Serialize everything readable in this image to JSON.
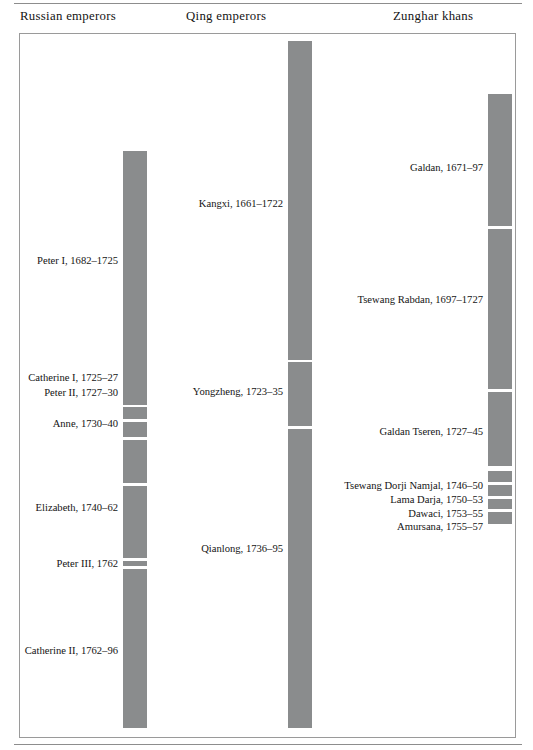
{
  "chart_data": {
    "type": "timeline",
    "title": "",
    "subtitle": "",
    "xlabel": "",
    "ylabel": "",
    "orientation": "vertical",
    "time_range": [
      1655,
      1800
    ],
    "grid": false,
    "legend": "none",
    "bar_color": "#8a8c8d",
    "frame": true,
    "columns": [
      {
        "id": "russian",
        "header": "Russian emperors",
        "bar_left_px": 103,
        "bar_width_px": 24,
        "label_align": "right",
        "label_right_px": 98,
        "reigns": [
          {
            "name": "Peter I",
            "years": "1682–1725",
            "label": "Peter I, 1682–1725",
            "start": 1682,
            "end": 1725,
            "top_px": 117,
            "height_px": 254,
            "label_y_px": 227
          },
          {
            "name": "Catherine I",
            "years": "1725–27",
            "label": "Catherine I, 1725–27",
            "start": 1725,
            "end": 1727,
            "top_px": 373,
            "height_px": 12,
            "label_y_px": 344
          },
          {
            "name": "Peter II",
            "years": "1727–30",
            "label": "Peter II, 1727–30",
            "start": 1727,
            "end": 1730,
            "top_px": 388,
            "height_px": 15,
            "label_y_px": 359
          },
          {
            "name": "Anne",
            "years": "1730–40",
            "label": "Anne, 1730–40",
            "start": 1730,
            "end": 1740,
            "top_px": 406,
            "height_px": 43,
            "label_y_px": 390
          },
          {
            "name": "Elizabeth",
            "years": "1740–62",
            "label": "Elizabeth, 1740–62",
            "start": 1740,
            "end": 1762,
            "top_px": 452,
            "height_px": 72,
            "label_y_px": 474
          },
          {
            "name": "Peter III",
            "years": "1762",
            "label": "Peter III, 1762",
            "start": 1762,
            "end": 1762,
            "top_px": 527,
            "height_px": 5,
            "label_y_px": 530
          },
          {
            "name": "Catherine II",
            "years": "1762–96",
            "label": "Catherine II, 1762–96",
            "start": 1762,
            "end": 1796,
            "top_px": 535,
            "height_px": 159,
            "label_y_px": 617
          }
        ]
      },
      {
        "id": "qing",
        "header": "Qing emperors",
        "bar_left_px": 268,
        "bar_width_px": 24,
        "label_align": "right",
        "label_right_px": 263,
        "reigns": [
          {
            "name": "Kangxi",
            "years": "1661–1722",
            "label": "Kangxi, 1661–1722",
            "start": 1661,
            "end": 1722,
            "top_px": 7,
            "height_px": 319,
            "label_y_px": 170
          },
          {
            "name": "Yongzheng",
            "years": "1723–35",
            "label": "Yongzheng, 1723–35",
            "start": 1723,
            "end": 1735,
            "top_px": 328,
            "height_px": 64,
            "label_y_px": 358
          },
          {
            "name": "Qianlong",
            "years": "1736–95",
            "label": "Qianlong, 1736–95",
            "start": 1736,
            "end": 1795,
            "top_px": 395,
            "height_px": 299,
            "label_y_px": 515
          }
        ]
      },
      {
        "id": "zunghar",
        "header": "Zunghar khans",
        "bar_left_px": 468,
        "bar_width_px": 24,
        "label_align": "right",
        "label_right_px": 463,
        "reigns": [
          {
            "name": "Galdan",
            "years": "1671–97",
            "label": "Galdan, 1671–97",
            "start": 1671,
            "end": 1697,
            "top_px": 60,
            "height_px": 132,
            "label_y_px": 134
          },
          {
            "name": "Tsewang Rabdan",
            "years": "1697–1727",
            "label": "Tsewang Rabdan, 1697–1727",
            "start": 1697,
            "end": 1727,
            "top_px": 195,
            "height_px": 160,
            "label_y_px": 266
          },
          {
            "name": "Galdan Tseren",
            "years": "1727–45",
            "label": "Galdan Tseren, 1727–45",
            "start": 1727,
            "end": 1745,
            "top_px": 358,
            "height_px": 74,
            "label_y_px": 398
          },
          {
            "name": "Tsewang Dorji Namjal",
            "years": "1746–50",
            "label": "Tsewang Dorji Namjal, 1746–50",
            "start": 1746,
            "end": 1750,
            "top_px": 437,
            "height_px": 11,
            "label_y_px": 452
          },
          {
            "name": "Lama Darja",
            "years": "1750–53",
            "label": "Lama Darja, 1750–53",
            "start": 1750,
            "end": 1753,
            "top_px": 451,
            "height_px": 11,
            "label_y_px": 466
          },
          {
            "name": "Dawaci",
            "years": "1753–55",
            "label": "Dawaci, 1753–55",
            "start": 1753,
            "end": 1755,
            "top_px": 465,
            "height_px": 10,
            "label_y_px": 480
          },
          {
            "name": "Amursana",
            "years": "1755–57",
            "label": "Amursana, 1755–57",
            "start": 1755,
            "end": 1757,
            "top_px": 478,
            "height_px": 12,
            "label_y_px": 493
          }
        ]
      }
    ]
  }
}
